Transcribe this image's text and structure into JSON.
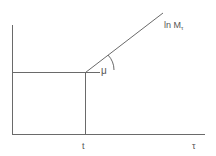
{
  "diagram": {
    "curve_label_main": "ln M",
    "curve_label_sub": "τ",
    "angle_label": "μ",
    "x_tick_label": "t",
    "x_axis_label": "τ"
  }
}
